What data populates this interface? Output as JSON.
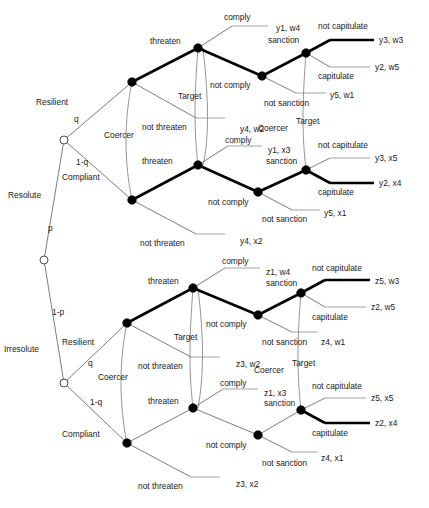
{
  "diagram": {
    "title": "",
    "type": "extensive-form-game-tree",
    "players": {
      "chance": "Nature",
      "coercer": "Coercer",
      "target": "Target"
    },
    "player_labels": {
      "coercer": "Coercer",
      "target": "Target"
    },
    "type_labels": {
      "resolute": "Resolute",
      "irresolute": "Irresolute",
      "resilient": "Resilient",
      "compliant": "Compliant"
    },
    "probabilities": {
      "p": "p",
      "one_minus_p": "1-p",
      "q": "q",
      "one_minus_q": "1-q"
    },
    "actions": {
      "threaten": "threaten",
      "not_threaten": "not threaten",
      "comply": "comply",
      "not_comply": "not comply",
      "sanction": "sanction",
      "not_sanction": "not sanction",
      "capitulate": "capitulate",
      "not_capitulate": "not capitulate"
    },
    "subtrees": [
      {
        "id": "resolute-resilient",
        "coercer_type": "Resolute",
        "target_type": "Resilient",
        "not_threaten_payoff": "y4, w2",
        "comply_payoff": "y1, w4",
        "not_sanction_payoff": "y5, w1",
        "not_capitulate_payoff": "y3, w3",
        "capitulate_payoff": "y2, w5",
        "equilibrium_path": [
          "threaten",
          "not comply",
          "sanction",
          "not capitulate"
        ]
      },
      {
        "id": "resolute-compliant",
        "coercer_type": "Resolute",
        "target_type": "Compliant",
        "not_threaten_payoff": "y4, x2",
        "comply_payoff": "y1, x3",
        "not_sanction_payoff": "y5, x1",
        "not_capitulate_payoff": "y3, x5",
        "capitulate_payoff": "y2, x4",
        "equilibrium_path": [
          "threaten",
          "not comply",
          "sanction",
          "capitulate"
        ]
      },
      {
        "id": "irresolute-resilient",
        "coercer_type": "Irresolute",
        "target_type": "Resilient",
        "not_threaten_payoff": "z3, w2",
        "comply_payoff": "z1, w4",
        "not_sanction_payoff": "z4, w1",
        "not_capitulate_payoff": "z5, w3",
        "capitulate_payoff": "z2, w5",
        "equilibrium_path": [
          "threaten",
          "not comply",
          "sanction",
          "not capitulate"
        ]
      },
      {
        "id": "irresolute-compliant",
        "coercer_type": "Irresolute",
        "target_type": "Compliant",
        "not_threaten_payoff": "z3, x2",
        "comply_payoff": "z1, x3",
        "not_sanction_payoff": "z4, x1",
        "not_capitulate_payoff": "z5, x5",
        "capitulate_payoff": "z2, x4",
        "equilibrium_path": [
          "threaten",
          "not comply",
          "sanction",
          "capitulate"
        ]
      }
    ],
    "colors": {
      "edge": "#5a5a5a",
      "bold_edge": "#000000",
      "text": "#1b1b1b",
      "background": "#ffffff"
    }
  }
}
